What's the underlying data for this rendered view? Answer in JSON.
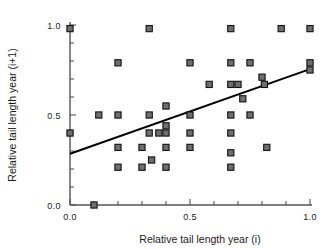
{
  "chart_data": {
    "type": "scatter",
    "title": "",
    "xlabel": "Relative tail length year (i)",
    "ylabel": "Relative tail length year (i+1)",
    "xlim": [
      0.0,
      1.0
    ],
    "ylim": [
      0.0,
      1.0
    ],
    "xticks": [
      0.0,
      0.5,
      1.0
    ],
    "yticks": [
      0.0,
      0.5,
      1.0
    ],
    "xtick_labels": [
      "0.0",
      "0.5",
      "1.0"
    ],
    "ytick_labels": [
      "0.0",
      "0.5",
      "1.0"
    ],
    "xminor_ticks": [
      0.1,
      0.2,
      0.3,
      0.4,
      0.6,
      0.7,
      0.8,
      0.9
    ],
    "yminor_ticks": [
      0.1,
      0.2,
      0.3,
      0.4,
      0.6,
      0.7,
      0.8,
      0.9
    ],
    "grid": false,
    "legend": null,
    "marker": "square",
    "marker_face_color": "#6e6e6e",
    "marker_edge_color": "#111111",
    "points": [
      {
        "x": 0.0,
        "y": 0.98
      },
      {
        "x": 0.0,
        "y": 0.4
      },
      {
        "x": 0.1,
        "y": 0.0
      },
      {
        "x": 0.2,
        "y": 0.79
      },
      {
        "x": 0.2,
        "y": 0.5
      },
      {
        "x": 0.2,
        "y": 0.32
      },
      {
        "x": 0.2,
        "y": 0.21
      },
      {
        "x": 0.12,
        "y": 0.5
      },
      {
        "x": 0.3,
        "y": 0.32
      },
      {
        "x": 0.3,
        "y": 0.21
      },
      {
        "x": 0.33,
        "y": 0.98
      },
      {
        "x": 0.33,
        "y": 0.5
      },
      {
        "x": 0.33,
        "y": 0.4
      },
      {
        "x": 0.34,
        "y": 0.25
      },
      {
        "x": 0.4,
        "y": 0.55
      },
      {
        "x": 0.4,
        "y": 0.44
      },
      {
        "x": 0.4,
        "y": 0.4
      },
      {
        "x": 0.4,
        "y": 0.32
      },
      {
        "x": 0.4,
        "y": 0.21
      },
      {
        "x": 0.37,
        "y": 0.4
      },
      {
        "x": 0.5,
        "y": 0.79
      },
      {
        "x": 0.5,
        "y": 0.5
      },
      {
        "x": 0.5,
        "y": 0.4
      },
      {
        "x": 0.5,
        "y": 0.32
      },
      {
        "x": 0.58,
        "y": 0.67
      },
      {
        "x": 0.67,
        "y": 0.98
      },
      {
        "x": 0.67,
        "y": 0.79
      },
      {
        "x": 0.67,
        "y": 0.67
      },
      {
        "x": 0.67,
        "y": 0.5
      },
      {
        "x": 0.67,
        "y": 0.4
      },
      {
        "x": 0.67,
        "y": 0.29
      },
      {
        "x": 0.67,
        "y": 0.21
      },
      {
        "x": 0.7,
        "y": 0.67
      },
      {
        "x": 0.72,
        "y": 0.59
      },
      {
        "x": 0.75,
        "y": 0.79
      },
      {
        "x": 0.75,
        "y": 0.5
      },
      {
        "x": 0.8,
        "y": 0.71
      },
      {
        "x": 0.81,
        "y": 0.67
      },
      {
        "x": 0.82,
        "y": 0.32
      },
      {
        "x": 0.88,
        "y": 0.98
      },
      {
        "x": 1.0,
        "y": 0.98
      },
      {
        "x": 1.0,
        "y": 0.79
      },
      {
        "x": 1.0,
        "y": 0.75
      }
    ],
    "fit_line": {
      "x0": 0.0,
      "y0": 0.285,
      "x1": 1.0,
      "y1": 0.755,
      "slope": 0.47,
      "intercept": 0.285
    }
  }
}
